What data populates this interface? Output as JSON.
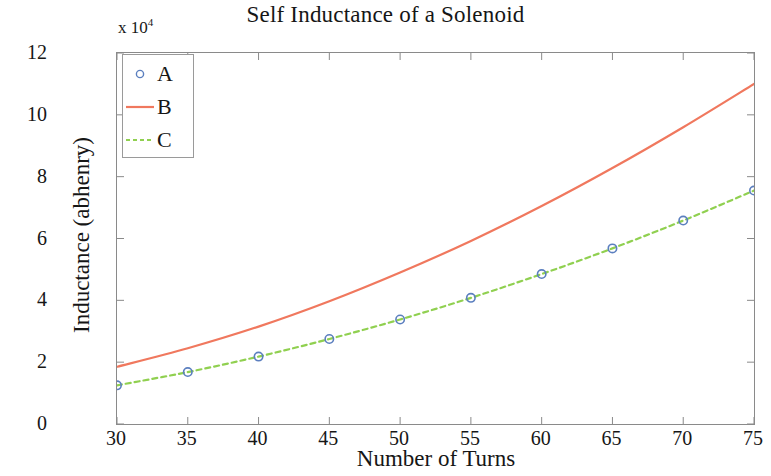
{
  "chart_data": {
    "type": "line",
    "title": "Self Inductance of a Solenoid",
    "xlabel": "Number of Turns",
    "ylabel": "Inductance (abhenry)",
    "y_multiplier_text": "x 10",
    "y_multiplier_exponent": "4",
    "xlim": [
      30,
      75
    ],
    "ylim": [
      0,
      12
    ],
    "xticks": [
      30,
      35,
      40,
      45,
      50,
      55,
      60,
      65,
      70,
      75
    ],
    "yticks": [
      0,
      2,
      4,
      6,
      8,
      10,
      12
    ],
    "grid": false,
    "legend_position": "upper left",
    "x": [
      30,
      35,
      40,
      45,
      50,
      55,
      60,
      65,
      70,
      75
    ],
    "series": [
      {
        "name": "A",
        "style": "markers",
        "marker": "circle-open",
        "color": "#5B7FBF",
        "values": [
          1.25,
          1.68,
          2.18,
          2.75,
          3.38,
          4.08,
          4.85,
          5.68,
          6.58,
          7.55
        ]
      },
      {
        "name": "B",
        "style": "solid",
        "color": "#F0785E",
        "values": [
          1.85,
          2.45,
          3.15,
          3.97,
          4.9,
          5.92,
          7.05,
          8.28,
          9.6,
          11.0
        ]
      },
      {
        "name": "C",
        "style": "dashed",
        "color": "#90D050",
        "values": [
          1.25,
          1.68,
          2.18,
          2.75,
          3.38,
          4.08,
          4.85,
          5.68,
          6.58,
          7.55
        ]
      }
    ],
    "legend": [
      "A",
      "B",
      "C"
    ]
  }
}
